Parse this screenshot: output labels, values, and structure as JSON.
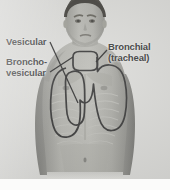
{
  "figure": {
    "kind": "anatomical-photo-diagram",
    "background_color": "#d7d7d4",
    "outline_color": "#262626",
    "label_color": "#2a2a2a",
    "skin_color": "#a9a9a4",
    "hair_color": "#3a3836"
  },
  "labels": [
    {
      "id": "vesicular",
      "name": "Vesicular",
      "lines": [
        "Vesicular"
      ],
      "position": "upper-left"
    },
    {
      "id": "bronchovesicular",
      "name": "Broncho-vesicular",
      "lines": [
        "Broncho-",
        "vesicular"
      ],
      "position": "mid-left"
    },
    {
      "id": "bronchial",
      "name": "Bronchial (tracheal)",
      "lines": [
        "Bronchial",
        "(tracheal)"
      ],
      "position": "upper-right"
    }
  ],
  "regions": [
    {
      "id": "tracheal-region",
      "label_ref": "bronchial",
      "description": "rounded outline over suprasternal notch and trachea"
    },
    {
      "id": "bronchovesicular-region",
      "label_ref": "bronchovesicular",
      "description": "outline over upper sternal border, 1st and 2nd intercostal spaces"
    },
    {
      "id": "vesicular-region",
      "label_ref": "vesicular",
      "description": "large outline over peripheral lung fields of chest"
    }
  ],
  "leaders": [
    {
      "id": "leader-vesicular",
      "from_label": "vesicular",
      "to_region": "vesicular-region"
    },
    {
      "id": "leader-bronchovesicular",
      "from_label": "bronchovesicular",
      "to_region": "bronchovesicular-region"
    },
    {
      "id": "leader-bronchial",
      "from_label": "bronchial",
      "to_region": "tracheal-region"
    }
  ]
}
